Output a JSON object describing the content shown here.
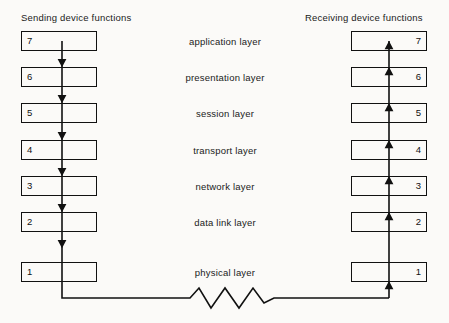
{
  "diagram": {
    "headers": {
      "sending": "Sending device functions",
      "receiving": "Receiving device functions"
    },
    "colors": {
      "line": "#111111",
      "text": "#1a1a1a",
      "background": "#fbfaf8"
    },
    "layers": [
      {
        "number": "7",
        "name": "application layer"
      },
      {
        "number": "6",
        "name": "presentation layer"
      },
      {
        "number": "5",
        "name": "session layer"
      },
      {
        "number": "4",
        "name": "transport layer"
      },
      {
        "number": "3",
        "name": "network layer"
      },
      {
        "number": "2",
        "name": "data link layer"
      },
      {
        "number": "1",
        "name": "physical layer"
      }
    ],
    "sending_numbers": [
      "7",
      "6",
      "5",
      "4",
      "3",
      "2",
      "1"
    ],
    "receiving_numbers": [
      "7",
      "6",
      "5",
      "4",
      "3",
      "2",
      "1"
    ],
    "medium": {
      "symbol": "zigzag-transmission-medium",
      "direction": "sending device physical layer to receiving device physical layer"
    }
  }
}
